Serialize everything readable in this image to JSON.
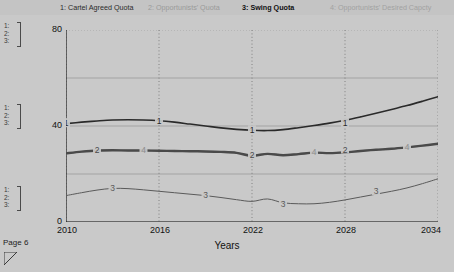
{
  "page": {
    "page_label": "Page 6",
    "background_color": "#c9c9c9",
    "resize_handle_icon": "resize-corner-icon"
  },
  "legend": {
    "items": [
      {
        "index": "1",
        "label": "1: Cartel Agreed Quota",
        "color": "#2b2b2b",
        "emphasis": "normal"
      },
      {
        "index": "2",
        "label": "2: Opportunists' Quota",
        "color": "#9a9a9a",
        "emphasis": "normal"
      },
      {
        "index": "3",
        "label": "3: Swing Quota",
        "color": "#111111",
        "emphasis": "bold"
      },
      {
        "index": "4",
        "label": "4: Opportunists' Desired Capcty",
        "color": "#a2a2a2",
        "emphasis": "normal"
      }
    ]
  },
  "scale_gutter": {
    "groups": [
      {
        "name": "group-top",
        "marks": [
          "1:",
          "2:",
          "3:"
        ]
      },
      {
        "name": "group-middle",
        "marks": [
          "1:",
          "2:",
          "3:"
        ]
      },
      {
        "name": "group-bottom",
        "marks": [
          "1:",
          "2:",
          "3:"
        ]
      }
    ]
  },
  "chart_data": {
    "type": "line",
    "title": "",
    "xlabel": "Years",
    "ylabel": "",
    "xlim": [
      2010,
      2034
    ],
    "ylim": [
      0,
      80
    ],
    "xticks": [
      2010,
      2016,
      2022,
      2028,
      2034
    ],
    "yticks": [
      0,
      40,
      80
    ],
    "yticks_minor": [
      20,
      60
    ],
    "grid": true,
    "legend_position": "top",
    "x": [
      2010,
      2011,
      2012,
      2013,
      2014,
      2015,
      2016,
      2017,
      2018,
      2019,
      2020,
      2021,
      2022,
      2023,
      2024,
      2025,
      2026,
      2027,
      2028,
      2029,
      2030,
      2031,
      2032,
      2033,
      2034
    ],
    "series": [
      {
        "name": "Cartel Agreed Quota",
        "index": "1",
        "color": "#2a2a2a",
        "width": 1.6,
        "marker_labels": [
          {
            "x": 2010,
            "y": 41
          },
          {
            "x": 2016,
            "y": 42
          },
          {
            "x": 2022,
            "y": 38
          },
          {
            "x": 2028,
            "y": 41
          }
        ],
        "values": [
          41.0,
          41.6,
          42.1,
          42.5,
          42.6,
          42.5,
          42.2,
          41.6,
          40.8,
          40.0,
          39.2,
          38.6,
          38.2,
          38.1,
          38.5,
          39.3,
          40.2,
          41.2,
          42.4,
          43.8,
          45.3,
          46.9,
          48.5,
          50.3,
          52.2
        ]
      },
      {
        "name": "Opportunists' Quota",
        "index": "2",
        "color": "#4a4a4a",
        "width": 2.4,
        "marker_labels": [
          {
            "x": 2012,
            "y": 29.8
          },
          {
            "x": 2022,
            "y": 27.6
          },
          {
            "x": 2028,
            "y": 30.0
          }
        ],
        "values": [
          28.6,
          29.3,
          29.8,
          29.9,
          29.8,
          29.8,
          29.7,
          29.6,
          29.5,
          29.4,
          29.2,
          28.8,
          27.6,
          28.4,
          27.8,
          28.3,
          28.9,
          28.7,
          29.0,
          29.6,
          30.1,
          30.5,
          31.1,
          31.8,
          32.6
        ]
      },
      {
        "name": "Swing Quota",
        "index": "3",
        "color": "#5a5a5a",
        "width": 1.0,
        "marker_labels": [
          {
            "x": 2013,
            "y": 14.0
          },
          {
            "x": 2019,
            "y": 11.0
          },
          {
            "x": 2024,
            "y": 7.4
          },
          {
            "x": 2030,
            "y": 12.6
          }
        ],
        "values": [
          11.0,
          12.2,
          13.3,
          14.0,
          13.9,
          13.4,
          12.8,
          12.2,
          11.6,
          11.0,
          10.2,
          9.3,
          8.6,
          9.6,
          8.0,
          7.6,
          7.6,
          8.2,
          9.2,
          10.4,
          11.6,
          12.8,
          14.2,
          16.0,
          18.0
        ]
      },
      {
        "name": "Opportunists' Desired Capcty",
        "index": "4",
        "color": "#8e8e8e",
        "width": 1.6,
        "marker_labels": [
          {
            "x": 2015,
            "y": 29.8
          },
          {
            "x": 2026,
            "y": 28.9
          },
          {
            "x": 2032,
            "y": 31.1
          }
        ],
        "values": [
          28.6,
          29.3,
          29.8,
          29.9,
          29.8,
          29.8,
          29.7,
          29.6,
          29.5,
          29.4,
          29.2,
          28.8,
          27.6,
          28.4,
          27.8,
          28.3,
          28.9,
          28.7,
          29.0,
          29.6,
          30.1,
          30.5,
          31.1,
          31.8,
          32.6
        ]
      }
    ]
  }
}
